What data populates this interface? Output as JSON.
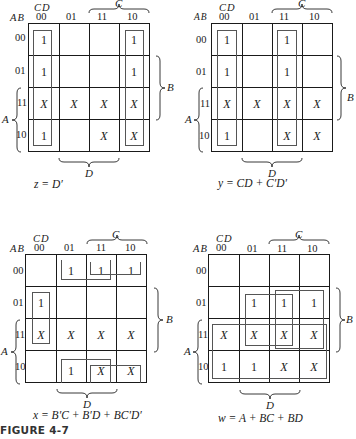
{
  "figure": {
    "caption": "FIGURE 4-7",
    "axis": {
      "row_var": "AB",
      "col_var": "CD",
      "col_labels": [
        "00",
        "01",
        "11",
        "10"
      ],
      "row_labels": [
        "00",
        "01",
        "11",
        "10"
      ],
      "brace_C": "C",
      "brace_D": "D",
      "brace_B": "B",
      "brace_A": "A"
    },
    "maps": [
      {
        "name": "z",
        "expression": "z = D′",
        "cells": [
          [
            "1",
            "",
            "",
            "1"
          ],
          [
            "1",
            "",
            "",
            "1"
          ],
          [
            "X",
            "X",
            "X",
            "X"
          ],
          [
            "1",
            "",
            "X",
            "X"
          ]
        ]
      },
      {
        "name": "y",
        "expression": "y = CD + C′D′",
        "cells": [
          [
            "1",
            "",
            "1",
            ""
          ],
          [
            "1",
            "",
            "1",
            ""
          ],
          [
            "X",
            "X",
            "X",
            "X"
          ],
          [
            "1",
            "",
            "X",
            "X"
          ]
        ]
      },
      {
        "name": "x",
        "expression": "x = B′C + B′D + BC′D′",
        "cells": [
          [
            "",
            "1",
            "1",
            "1"
          ],
          [
            "1",
            "",
            "",
            ""
          ],
          [
            "X",
            "X",
            "X",
            "X"
          ],
          [
            "",
            "1",
            "X",
            "X"
          ]
        ]
      },
      {
        "name": "w",
        "expression": "w = A + BC + BD",
        "cells": [
          [
            "",
            "",
            "",
            ""
          ],
          [
            "",
            "1",
            "1",
            "1"
          ],
          [
            "X",
            "X",
            "X",
            "X"
          ],
          [
            "1",
            "1",
            "X",
            "X"
          ]
        ]
      }
    ]
  }
}
